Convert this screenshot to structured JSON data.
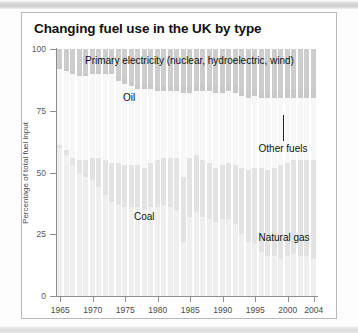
{
  "figure": {
    "title": "Changing fuel use in the UK by type"
  },
  "axes": {
    "y": {
      "label": "Percentage of total fuel input",
      "ticks": [
        0,
        25,
        50,
        75,
        100
      ],
      "min": 0,
      "max": 100
    },
    "x": {
      "ticks": [
        "1965",
        "1970",
        "1975",
        "1980",
        "1985",
        "1990",
        "1995",
        "2000",
        "2004"
      ],
      "min": 1965,
      "max": 2004
    }
  },
  "labels": {
    "primary_electricity": "Primary electricity (nuclear, hydroelectric, wind)",
    "oil": "Oil",
    "coal": "Coal",
    "other_fuels": "Other fuels",
    "natural_gas": "Natural gas"
  },
  "colors": {
    "coal": "#efefef",
    "natural_gas": "#e3e3e3",
    "oil": "#f7f7f7",
    "other_fuels": "#c9c9c9",
    "primary_electricity": "#cdcdcd",
    "axis": "#8e8e8e",
    "text": "#111111",
    "frame": "#b9b9b9"
  },
  "chart_data": {
    "type": "area",
    "subtype": "stacked-column-percentage",
    "title": "Changing fuel use in the UK by type",
    "xlabel": "",
    "ylabel": "Percentage of total fuel input",
    "ylim": [
      0,
      100
    ],
    "xlim": [
      1965,
      2004
    ],
    "grid": false,
    "legend": "in-plot-annotations",
    "stack_order_bottom_to_top": [
      "Coal",
      "Natural gas",
      "Oil",
      "Other fuels",
      "Primary electricity"
    ],
    "x": [
      1965,
      1966,
      1967,
      1968,
      1969,
      1970,
      1971,
      1972,
      1973,
      1974,
      1975,
      1976,
      1977,
      1978,
      1979,
      1980,
      1981,
      1982,
      1983,
      1984,
      1985,
      1986,
      1987,
      1988,
      1989,
      1990,
      1991,
      1992,
      1993,
      1994,
      1995,
      1996,
      1997,
      1998,
      1999,
      2000,
      2001,
      2002,
      2003,
      2004
    ],
    "series": [
      {
        "name": "Coal",
        "values": [
          60,
          57,
          53,
          50,
          48,
          47,
          44,
          41,
          38,
          37,
          36,
          36,
          36,
          35,
          36,
          36,
          37,
          36,
          35,
          22,
          32,
          34,
          32,
          31,
          30,
          31,
          31,
          29,
          25,
          22,
          21,
          18,
          16,
          16,
          15,
          16,
          17,
          16,
          16,
          15
        ]
      },
      {
        "name": "Natural gas",
        "values": [
          1,
          2,
          3,
          5,
          7,
          9,
          12,
          14,
          16,
          17,
          17,
          17,
          17,
          17,
          18,
          19,
          19,
          20,
          21,
          26,
          24,
          23,
          23,
          23,
          22,
          22,
          23,
          24,
          27,
          29,
          31,
          34,
          35,
          36,
          38,
          38,
          38,
          39,
          39,
          40
        ]
      },
      {
        "name": "Oil",
        "values": [
          31,
          32,
          34,
          34,
          34,
          34,
          34,
          35,
          36,
          33,
          33,
          32,
          31,
          32,
          30,
          28,
          27,
          27,
          27,
          34,
          26,
          26,
          28,
          29,
          30,
          29,
          29,
          29,
          29,
          29,
          29,
          28,
          29,
          28,
          27,
          26,
          25,
          25,
          25,
          25
        ]
      },
      {
        "name": "Other fuels",
        "values": [
          1,
          1,
          1,
          1,
          1,
          1,
          1,
          1,
          1,
          2,
          2,
          2,
          2,
          2,
          2,
          2,
          2,
          2,
          2,
          3,
          3,
          3,
          3,
          3,
          3,
          3,
          3,
          3,
          3,
          3,
          3,
          3,
          3,
          3,
          3,
          4,
          4,
          4,
          4,
          4
        ]
      },
      {
        "name": "Primary electricity",
        "values": [
          7,
          8,
          9,
          10,
          10,
          9,
          9,
          9,
          9,
          11,
          12,
          13,
          14,
          14,
          14,
          15,
          15,
          15,
          15,
          15,
          15,
          14,
          14,
          14,
          15,
          15,
          14,
          15,
          16,
          17,
          16,
          17,
          17,
          17,
          17,
          16,
          16,
          16,
          16,
          16
        ]
      }
    ]
  }
}
